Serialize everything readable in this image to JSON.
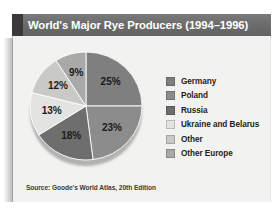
{
  "title": {
    "text": "World's Major Rye Producers (1994–1996)"
  },
  "source": {
    "text": "Source: Goode's World Atlas, 20th Edition"
  },
  "chart_data": {
    "type": "pie",
    "title": "World's Major Rye Producers (1994–1996)",
    "xlabel": "",
    "ylabel": "",
    "units": "percent",
    "legend_position": "right",
    "grid": false,
    "start_angle_deg": 0,
    "direction": "clockwise",
    "categories": [
      "Germany",
      "Poland",
      "Russia",
      "Ukraine and Belarus",
      "Other",
      "Other Europe"
    ],
    "values": [
      25,
      23,
      18,
      13,
      12,
      9
    ],
    "data_labels": [
      "25%",
      "23%",
      "18%",
      "13%",
      "12%",
      "9%"
    ],
    "colors": [
      "#7f7f7f",
      "#8c8c8c",
      "#6e6e6e",
      "#e3e3e1",
      "#c9c9c7",
      "#a9a9a7"
    ],
    "slices": [
      {
        "label": "Germany",
        "value": 25,
        "data_label": "25%",
        "color": "#7f7f7f"
      },
      {
        "label": "Poland",
        "value": 23,
        "data_label": "23%",
        "color": "#8c8c8c"
      },
      {
        "label": "Russia",
        "value": 18,
        "data_label": "18%",
        "color": "#6e6e6e"
      },
      {
        "label": "Ukraine and Belarus",
        "value": 13,
        "data_label": "13%",
        "color": "#e3e3e1"
      },
      {
        "label": "Other",
        "value": 12,
        "data_label": "12%",
        "color": "#c9c9c7"
      },
      {
        "label": "Other Europe",
        "value": 9,
        "data_label": "9%",
        "color": "#a9a9a7"
      }
    ]
  },
  "legend": {
    "items": [
      {
        "label": "Germany",
        "color": "#7f7f7f"
      },
      {
        "label": "Poland",
        "color": "#8c8c8c"
      },
      {
        "label": "Russia",
        "color": "#6e6e6e"
      },
      {
        "label": "Ukraine and Belarus",
        "color": "#e3e3e1"
      },
      {
        "label": "Other",
        "color": "#c9c9c7"
      },
      {
        "label": "Other Europe",
        "color": "#a9a9a7"
      }
    ]
  },
  "colors": {
    "title_bar": "#6e6e6e",
    "title_accent": "#3a3a3a",
    "panel_background": "#f2f2f0",
    "title_text": "#ffffff",
    "label_text": "#1c1c1c"
  }
}
